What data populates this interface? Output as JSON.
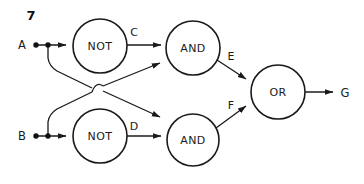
{
  "figure": {
    "number": "7",
    "kind": "logic-circuit-diagram",
    "width": 364,
    "height": 184,
    "background_color": "#ffffff",
    "line_color": "#1a1a1a"
  },
  "inputs": [
    {
      "id": "A",
      "label": "A",
      "x": 22,
      "y": 45
    },
    {
      "id": "B",
      "label": "B",
      "x": 22,
      "y": 136
    }
  ],
  "outputs": [
    {
      "id": "G",
      "label": "G",
      "x": 345,
      "y": 93
    }
  ],
  "gates": [
    {
      "id": "not_a",
      "label": "NOT",
      "cx": 100,
      "cy": 46,
      "r": 27
    },
    {
      "id": "not_b",
      "label": "NOT",
      "cx": 100,
      "cy": 136,
      "r": 27
    },
    {
      "id": "and_top",
      "label": "AND",
      "cx": 193,
      "cy": 48,
      "r": 27
    },
    {
      "id": "and_bottom",
      "label": "AND",
      "cx": 193,
      "cy": 140,
      "r": 26
    },
    {
      "id": "or_gate",
      "label": "OR",
      "cx": 278,
      "cy": 92,
      "r": 27
    }
  ],
  "wire_labels": [
    {
      "id": "C",
      "label": "C",
      "x": 134,
      "y": 32
    },
    {
      "id": "D",
      "label": "D",
      "x": 134,
      "y": 126
    },
    {
      "id": "E",
      "label": "E",
      "x": 231,
      "y": 56
    },
    {
      "id": "F",
      "label": "F",
      "x": 231,
      "y": 105
    }
  ],
  "junction_dots": [
    {
      "id": "a-terminal",
      "cx": 36,
      "cy": 45
    },
    {
      "id": "a-branch",
      "cx": 48,
      "cy": 45
    },
    {
      "id": "b-terminal",
      "cx": 36,
      "cy": 136
    },
    {
      "id": "b-branch",
      "cx": 48,
      "cy": 136
    }
  ],
  "crossing": {
    "id": "wire-hop",
    "x": 97,
    "y": 89,
    "note": "no-connection hop"
  }
}
